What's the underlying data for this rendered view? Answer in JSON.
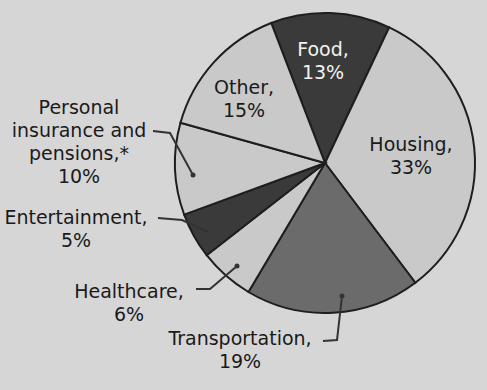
{
  "chart_data": {
    "type": "pie",
    "title": "",
    "slices": [
      {
        "label": "Food",
        "value": 13,
        "color": "#3a3a3a",
        "text_color": "#f2f2f2"
      },
      {
        "label": "Housing",
        "value": 33,
        "color": "#c9c9c9",
        "text_color": "#1a1a1a"
      },
      {
        "label": "Transportation",
        "value": 19,
        "color": "#6b6b6b",
        "text_color": "#1a1a1a"
      },
      {
        "label": "Healthcare",
        "value": 6,
        "color": "#c9c9c9",
        "text_color": "#1a1a1a"
      },
      {
        "label": "Entertainment",
        "value": 5,
        "color": "#3a3a3a",
        "text_color": "#1a1a1a"
      },
      {
        "label": "Personal insurance and pensions,*",
        "value": 10,
        "color": "#c9c9c9",
        "text_color": "#1a1a1a"
      },
      {
        "label": "Other",
        "value": 15,
        "color": "#c9c9c9",
        "text_color": "#1a1a1a"
      }
    ],
    "legend": "none",
    "labels_position": "inside and outside with leader lines"
  },
  "labels": {
    "food": {
      "name": "Food,",
      "pct": "13%"
    },
    "housing": {
      "name": "Housing,",
      "pct": "33%"
    },
    "transportation": {
      "name": "Transportation,",
      "pct": "19%"
    },
    "healthcare": {
      "name": "Healthcare,",
      "pct": "6%"
    },
    "entertainment": {
      "name": "Entertainment,",
      "pct": "5%"
    },
    "personal": {
      "line1": "Personal",
      "line2": "insurance and",
      "line3": "pensions,*",
      "pct": "10%"
    },
    "other": {
      "name": "Other,",
      "pct": "15%"
    }
  }
}
